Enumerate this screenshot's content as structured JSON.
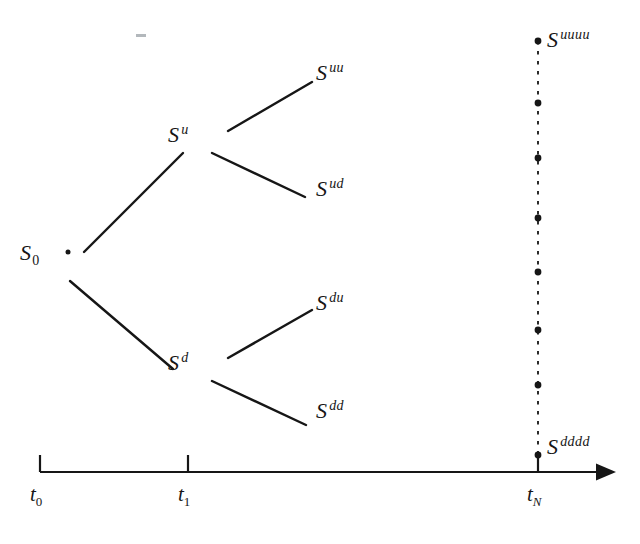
{
  "figure": {
    "type": "binomial-tree-diagram",
    "background_color": "#ffffff",
    "ink_color": "#161616",
    "nodes": [
      {
        "id": "s0",
        "base": "S",
        "sub": "0",
        "sup": "",
        "label": "S_0",
        "x": 20,
        "y": 240,
        "dot_x": 68,
        "dot_y": 252
      },
      {
        "id": "su",
        "base": "S",
        "sub": "",
        "sup": "u",
        "label": "S^u",
        "x": 168,
        "y": 122,
        "dot_x": 215,
        "dot_y": 142
      },
      {
        "id": "sd",
        "base": "S",
        "sub": "",
        "sup": "d",
        "label": "S^d",
        "x": 168,
        "y": 350,
        "dot_x": 215,
        "dot_y": 368
      },
      {
        "id": "suu",
        "base": "S",
        "sub": "",
        "sup": "uu",
        "label": "S^uu",
        "x": 316,
        "y": 60,
        "dot_x": 312,
        "dot_y": 82
      },
      {
        "id": "sud",
        "base": "S",
        "sub": "",
        "sup": "ud",
        "label": "S^ud",
        "x": 316,
        "y": 176,
        "dot_x": 308,
        "dot_y": 196
      },
      {
        "id": "sdu",
        "base": "S",
        "sub": "",
        "sup": "du",
        "label": "S^du",
        "x": 316,
        "y": 290,
        "dot_x": 312,
        "dot_y": 310
      },
      {
        "id": "sdd",
        "base": "S",
        "sub": "",
        "sup": "dd",
        "label": "S^dd",
        "x": 316,
        "y": 398,
        "dot_x": 308,
        "dot_y": 424
      },
      {
        "id": "suuuu",
        "base": "S",
        "sub": "",
        "sup": "uuuu",
        "label": "S^uuuu",
        "x": 547,
        "y": 27,
        "dot_x": 538,
        "dot_y": 41
      },
      {
        "id": "sdddd",
        "base": "S",
        "sub": "",
        "sup": "dddd",
        "label": "S^dddd",
        "x": 547,
        "y": 434,
        "dot_x": 538,
        "dot_y": 455
      }
    ],
    "edges": [
      {
        "from": "s0",
        "to": "su",
        "x1": 84,
        "y1": 252,
        "x2": 183,
        "y2": 153
      },
      {
        "from": "s0",
        "to": "sd",
        "x1": 70,
        "y1": 281,
        "x2": 173,
        "y2": 369
      },
      {
        "from": "su",
        "to": "suu",
        "x1": 228,
        "y1": 131,
        "x2": 312,
        "y2": 82
      },
      {
        "from": "su",
        "to": "sud",
        "x1": 212,
        "y1": 153,
        "x2": 305,
        "y2": 197
      },
      {
        "from": "sd",
        "to": "sdu",
        "x1": 228,
        "y1": 358,
        "x2": 312,
        "y2": 310
      },
      {
        "from": "sd",
        "to": "sdd",
        "x1": 212,
        "y1": 381,
        "x2": 306,
        "y2": 425
      }
    ],
    "terminal_column": {
      "x": 538,
      "y_top": 41,
      "y_bottom": 455,
      "style": "dashed",
      "intermediate_dots_y": [
        103,
        158,
        218,
        272,
        330,
        385
      ]
    },
    "axis": {
      "y": 472,
      "x_start": 40,
      "x_end": 616,
      "arrow": true,
      "ticks": [
        {
          "id": "t0",
          "base": "t",
          "sub": "0",
          "label": "t_0",
          "x": 40,
          "label_x": 30,
          "label_y": 482
        },
        {
          "id": "t1",
          "base": "t",
          "sub": "1",
          "label": "t_1",
          "x": 188,
          "label_x": 178,
          "label_y": 482
        },
        {
          "id": "tN",
          "base": "t",
          "sub": "N",
          "label": "t_N",
          "x": 538,
          "label_x": 527,
          "label_y": 482
        }
      ]
    },
    "artifact": {
      "x": 136,
      "y": 34,
      "width": 10,
      "height": 3
    }
  }
}
